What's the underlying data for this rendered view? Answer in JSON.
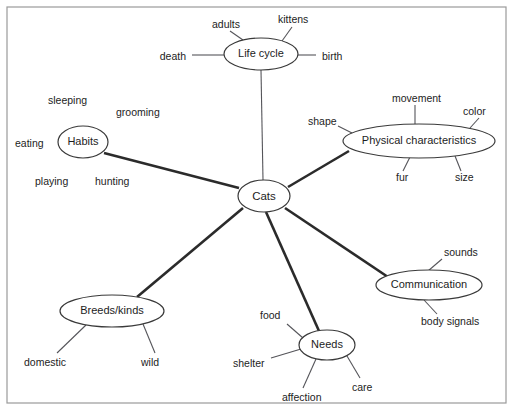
{
  "diagram": {
    "type": "mind-map",
    "topic": "Cats",
    "background_color": "#ffffff",
    "border_color": "#9a9a9a",
    "node_stroke_color": "#3a3a3a",
    "major_link_color": "#2b2b2b",
    "minor_link_color": "#55555a",
    "text_color": "#1d1d1d",
    "center": {
      "label": "Cats",
      "cx": 264,
      "cy": 196,
      "rx": 26,
      "ry": 16,
      "font_size": 11.5
    },
    "branches": [
      {
        "id": "life-cycle",
        "label": "Life cycle",
        "cx": 261,
        "cy": 54,
        "rx": 37,
        "ry": 16,
        "font_size": 11,
        "leaves": [
          {
            "label": "adults",
            "x": 212,
            "y": 25,
            "anchor": "start",
            "lx1": 243,
            "ly1": 40,
            "lx2": 230,
            "ly2": 31,
            "font_size": 10.5
          },
          {
            "label": "kittens",
            "x": 278,
            "y": 20,
            "anchor": "start",
            "lx1": 282,
            "ly1": 41,
            "lx2": 292,
            "ly2": 27,
            "font_size": 10.5
          },
          {
            "label": "death",
            "x": 186,
            "y": 57,
            "anchor": "end",
            "lx1": 224,
            "ly1": 55,
            "lx2": 192,
            "ly2": 55,
            "font_size": 10.5
          },
          {
            "label": "birth",
            "x": 322,
            "y": 57,
            "anchor": "start",
            "lx1": 298,
            "ly1": 55,
            "lx2": 316,
            "ly2": 55,
            "font_size": 10.5
          }
        ]
      },
      {
        "id": "physical-characteristics",
        "label": "Physical characteristics",
        "cx": 419,
        "cy": 141,
        "rx": 76,
        "ry": 17,
        "font_size": 11,
        "leaves": [
          {
            "label": "movement",
            "x": 392,
            "y": 99,
            "anchor": "start",
            "lx1": 415,
            "ly1": 124,
            "lx2": 415,
            "ly2": 105,
            "font_size": 10.5
          },
          {
            "label": "color",
            "x": 463,
            "y": 112,
            "anchor": "start",
            "lx1": 470,
            "ly1": 128,
            "lx2": 479,
            "ly2": 118,
            "font_size": 10.5
          },
          {
            "label": "shape",
            "x": 308,
            "y": 122,
            "anchor": "start",
            "lx1": 352,
            "ly1": 133,
            "lx2": 338,
            "ly2": 126,
            "font_size": 10.5
          },
          {
            "label": "fur",
            "x": 396,
            "y": 178,
            "anchor": "start",
            "lx1": 410,
            "ly1": 157,
            "lx2": 403,
            "ly2": 171,
            "font_size": 10.5
          },
          {
            "label": "size",
            "x": 455,
            "y": 178,
            "anchor": "start",
            "lx1": 455,
            "ly1": 156,
            "lx2": 461,
            "ly2": 171,
            "font_size": 10.5
          }
        ]
      },
      {
        "id": "habits",
        "label": "Habits",
        "cx": 83,
        "cy": 142,
        "rx": 25,
        "ry": 16,
        "font_size": 11,
        "leaves": [
          {
            "label": "sleeping",
            "x": 48,
            "y": 101,
            "anchor": "start",
            "font_size": 10.5
          },
          {
            "label": "grooming",
            "x": 116,
            "y": 113,
            "anchor": "start",
            "font_size": 10.5
          },
          {
            "label": "eating",
            "x": 15,
            "y": 144,
            "anchor": "start",
            "font_size": 10.5
          },
          {
            "label": "playing",
            "x": 35,
            "y": 182,
            "anchor": "start",
            "font_size": 10.5
          },
          {
            "label": "hunting",
            "x": 95,
            "y": 182,
            "anchor": "start",
            "font_size": 10.5
          }
        ]
      },
      {
        "id": "communication",
        "label": "Communication",
        "cx": 429,
        "cy": 285,
        "rx": 53,
        "ry": 15,
        "font_size": 11,
        "leaves": [
          {
            "label": "sounds",
            "x": 444,
            "y": 253,
            "anchor": "start",
            "lx1": 428,
            "ly1": 271,
            "lx2": 442,
            "ly2": 259,
            "font_size": 10.5
          },
          {
            "label": "body signals",
            "x": 421,
            "y": 322,
            "anchor": "start",
            "lx1": 424,
            "ly1": 300,
            "lx2": 437,
            "ly2": 314,
            "font_size": 10.5
          }
        ]
      },
      {
        "id": "breeds-kinds",
        "label": "Breeds/kinds",
        "cx": 112,
        "cy": 311,
        "rx": 52,
        "ry": 16,
        "font_size": 11,
        "leaves": [
          {
            "label": "domestic",
            "x": 24,
            "y": 363,
            "anchor": "start",
            "lx1": 86,
            "ly1": 325,
            "lx2": 57,
            "ly2": 353,
            "font_size": 10.5
          },
          {
            "label": "wild",
            "x": 141,
            "y": 363,
            "anchor": "start",
            "lx1": 143,
            "ly1": 324,
            "lx2": 155,
            "ly2": 353,
            "font_size": 10.5
          }
        ]
      },
      {
        "id": "needs",
        "label": "Needs",
        "cx": 327,
        "cy": 345,
        "rx": 28,
        "ry": 15,
        "font_size": 11,
        "leaves": [
          {
            "label": "food",
            "x": 260,
            "y": 316,
            "anchor": "start",
            "lx1": 303,
            "ly1": 338,
            "lx2": 287,
            "ly2": 324,
            "font_size": 10.5
          },
          {
            "label": "shelter",
            "x": 233,
            "y": 364,
            "anchor": "start",
            "lx1": 301,
            "ly1": 349,
            "lx2": 271,
            "ly2": 358,
            "font_size": 10.5
          },
          {
            "label": "affection",
            "x": 282,
            "y": 398,
            "anchor": "start",
            "lx1": 316,
            "ly1": 359,
            "lx2": 303,
            "ly2": 388,
            "font_size": 10.5
          },
          {
            "label": "care",
            "x": 352,
            "y": 388,
            "anchor": "start",
            "lx1": 347,
            "ly1": 356,
            "lx2": 360,
            "ly2": 378,
            "font_size": 10.5
          }
        ]
      }
    ],
    "center_links": [
      {
        "id": "link-cats-life-cycle",
        "x1": 263,
        "y1": 180,
        "x2": 261,
        "y2": 70,
        "weight": "minor"
      },
      {
        "id": "link-cats-physical",
        "x1": 288,
        "y1": 187,
        "x2": 349,
        "y2": 151,
        "weight": "major"
      },
      {
        "id": "link-cats-habits",
        "x1": 239,
        "y1": 188,
        "x2": 104,
        "y2": 153,
        "weight": "major"
      },
      {
        "id": "link-cats-communication",
        "x1": 285,
        "y1": 208,
        "x2": 388,
        "y2": 277,
        "weight": "major"
      },
      {
        "id": "link-cats-breeds",
        "x1": 243,
        "y1": 208,
        "x2": 137,
        "y2": 297,
        "weight": "major"
      },
      {
        "id": "link-cats-needs",
        "x1": 266,
        "y1": 212,
        "x2": 319,
        "y2": 331,
        "weight": "major"
      }
    ],
    "border_rect": {
      "x": 7,
      "y": 7,
      "width": 499,
      "height": 396
    }
  }
}
